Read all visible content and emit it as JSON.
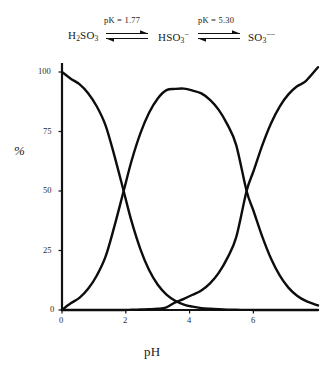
{
  "scheme": {
    "species": [
      {
        "name": "H2SO3",
        "text": "H₂SO₃"
      },
      {
        "name": "HSO3-",
        "text": "HSO₃⁻"
      },
      {
        "name": "SO3--",
        "text": "SO₃⁻⁻"
      }
    ],
    "equilibria": [
      {
        "label": "pK = 1.77",
        "arrow": "double-harpoon-arrow"
      },
      {
        "label": "pK = 5.30",
        "arrow": "double-harpoon-arrow"
      }
    ]
  },
  "chart_data": {
    "type": "line",
    "title": "",
    "xlabel": "pH",
    "ylabel": "%",
    "xlim": [
      0,
      7.35
    ],
    "ylim": [
      0,
      105
    ],
    "xticks": [
      0,
      2,
      4,
      6
    ],
    "yticks": [
      0,
      25,
      50,
      75,
      100
    ],
    "xticklabels": [
      "0",
      "2",
      "4",
      "6"
    ],
    "yticklabels": [
      "0",
      "25",
      "50",
      "75",
      "100"
    ],
    "grid": false,
    "legend": "none",
    "pk_values": [
      1.77,
      5.3
    ],
    "x": [
      0,
      0.25,
      0.5,
      0.75,
      1,
      1.25,
      1.5,
      1.77,
      2,
      2.25,
      2.5,
      2.75,
      3,
      3.25,
      3.5,
      3.75,
      4,
      4.25,
      4.5,
      4.75,
      5,
      5.3,
      5.5,
      5.75,
      6,
      6.25,
      6.5,
      6.75,
      7,
      7.35
    ],
    "series": [
      {
        "name": "H2SO3",
        "label": "H₂SO₃",
        "values": [
          100,
          97.2,
          94.9,
          91.1,
          85.5,
          77.6,
          65.1,
          50,
          37.1,
          25.6,
          16.8,
          10.6,
          6.5,
          3.9,
          2.3,
          1.4,
          0.8,
          0.5,
          0.3,
          0.16,
          0.09,
          0.05,
          0.03,
          0.02,
          0.01,
          0,
          0,
          0,
          0,
          0
        ]
      },
      {
        "name": "HSO3-",
        "label": "HSO₃⁻",
        "values": [
          0,
          2.8,
          5.1,
          8.9,
          14.5,
          22.4,
          34.9,
          50,
          62.8,
          74.2,
          82.9,
          88.9,
          92.4,
          92.9,
          93.0,
          92.2,
          91.0,
          88.3,
          84.1,
          77.9,
          69.4,
          50,
          41.6,
          30.8,
          21.6,
          14.5,
          9.4,
          6.0,
          3.8,
          1.9
        ]
      },
      {
        "name": "SO3--",
        "label": "SO₃⁻⁻",
        "values": [
          0,
          0,
          0,
          0,
          0,
          0,
          0,
          0,
          0.1,
          0.2,
          0.3,
          0.5,
          1.1,
          3.2,
          4.7,
          6.4,
          8.2,
          11.2,
          15.6,
          21.9,
          30.5,
          50,
          58.4,
          69.2,
          78.4,
          85.5,
          90.6,
          94.0,
          96.2,
          102
        ]
      }
    ]
  }
}
